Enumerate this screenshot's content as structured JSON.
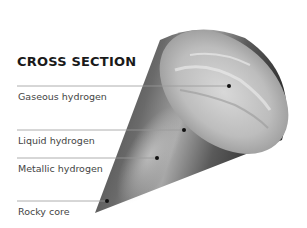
{
  "diagram": {
    "title": "CROSS SECTION",
    "labels": [
      {
        "text": "Gaseous hydrogen",
        "line_y": 86,
        "dot_x": 229
      },
      {
        "text": "Liquid hydrogen",
        "line_y": 130,
        "dot_x": 184
      },
      {
        "text": "Metallic hydrogen",
        "line_y": 158,
        "dot_x": 157
      },
      {
        "text": "Rocky core",
        "line_y": 201,
        "dot_x": 107
      }
    ],
    "colors": {
      "text": "#444444",
      "title": "#1a1a1a",
      "leader_line": "#9a9a9a",
      "dot": "#111111"
    }
  }
}
